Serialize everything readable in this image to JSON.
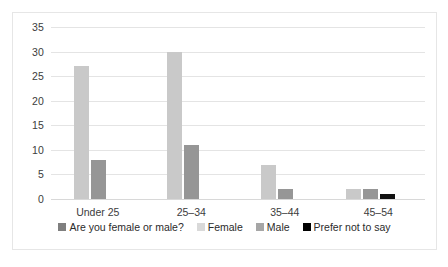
{
  "chart_data": {
    "type": "bar",
    "title": "",
    "xlabel": "",
    "ylabel": "",
    "categories": [
      "Under 25",
      "25–34",
      "35–44",
      "45–54"
    ],
    "series": [
      {
        "name": "Are you female or male?",
        "color": "#7f7f7f",
        "values": [
          0,
          0,
          0,
          0
        ]
      },
      {
        "name": "Female",
        "color": "#c9c9c9",
        "values": [
          27,
          30,
          7,
          2
        ]
      },
      {
        "name": "Male",
        "color": "#969696",
        "values": [
          8,
          11,
          2,
          2
        ]
      },
      {
        "name": "Prefer not to say",
        "color": "#111111",
        "values": [
          0,
          0,
          0,
          1
        ]
      }
    ],
    "yticks": [
      0,
      5,
      10,
      15,
      20,
      25,
      30,
      35
    ],
    "ylim": [
      0,
      35
    ],
    "grid": true,
    "legend_position": "bottom"
  },
  "legend": {
    "items": [
      {
        "label": "Are you female or male?",
        "swatch": "#7f7f7f"
      },
      {
        "label": "Female",
        "swatch": "#d9d9d9"
      },
      {
        "label": "Male",
        "swatch": "#a6a6a6"
      },
      {
        "label": "Prefer not to say",
        "swatch": "#000000"
      }
    ]
  }
}
